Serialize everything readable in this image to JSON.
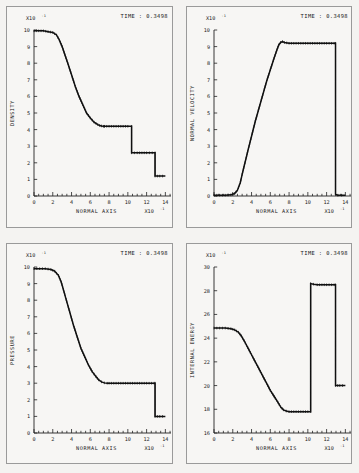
{
  "figure": {
    "background_color": "#f4f3f1",
    "panel_border_color": "#9a9a9a",
    "curve_color": "#111111",
    "time_prefix": "TIME :",
    "time_value": "0.3498",
    "time_label": "TIME : 0.3498"
  },
  "axis_common": {
    "xlabel": "NORMAL AXIS",
    "x_exponent_mantissa": "X10",
    "x_exponent_power": "-1",
    "y_exponent_mantissa": "X10",
    "y_exponent_power": "-1",
    "xticks": [
      0,
      2,
      4,
      6,
      8,
      10,
      12,
      14
    ],
    "xtick_labels": [
      "0",
      "2",
      "4",
      "6",
      "8",
      "10",
      "12",
      "14"
    ],
    "xlim": [
      0,
      14.6
    ]
  },
  "chart_data": [
    {
      "type": "line",
      "panel": "top-left",
      "title": "",
      "ylabel": "DENSITY",
      "xlabel": "NORMAL AXIS",
      "annotation": "TIME : 0.3498",
      "x_scale_label": "X10-1",
      "y_scale_label": "X10-1",
      "xlim": [
        0,
        14.6
      ],
      "ylim": [
        0,
        10
      ],
      "yticks": [
        0,
        1,
        2,
        3,
        4,
        5,
        6,
        7,
        8,
        9,
        10
      ],
      "ytick_labels": [
        "0",
        "1",
        "2",
        "3",
        "4",
        "5",
        "6",
        "7",
        "8",
        "9",
        "10"
      ],
      "grid": false,
      "legend": "none",
      "markers": "dense-tick-symbols",
      "series": [
        {
          "name": "density",
          "x": [
            0.0,
            0.5,
            1.0,
            1.5,
            2.0,
            2.4,
            2.7,
            3.0,
            3.3,
            3.6,
            4.0,
            4.4,
            4.8,
            5.2,
            5.6,
            6.0,
            6.4,
            6.8,
            7.0,
            7.2,
            7.4,
            7.5,
            7.5,
            8.0,
            9.0,
            10.0,
            10.4,
            10.4,
            11.0,
            12.0,
            12.9,
            12.9,
            13.4,
            14.0
          ],
          "y": [
            9.95,
            9.95,
            9.95,
            9.9,
            9.85,
            9.7,
            9.4,
            9.0,
            8.5,
            8.0,
            7.3,
            6.6,
            6.0,
            5.5,
            5.0,
            4.7,
            4.45,
            4.3,
            4.25,
            4.22,
            4.2,
            4.2,
            4.2,
            4.2,
            4.2,
            4.2,
            4.2,
            2.6,
            2.6,
            2.6,
            2.6,
            1.2,
            1.2,
            1.2
          ]
        }
      ]
    },
    {
      "type": "line",
      "panel": "top-right",
      "title": "",
      "ylabel": "NORMAL VELOCITY",
      "xlabel": "NORMAL AXIS",
      "annotation": "TIME : 0.3498",
      "x_scale_label": "X10-1",
      "y_scale_label": "X10-1",
      "xlim": [
        0,
        14.6
      ],
      "ylim": [
        0,
        10
      ],
      "yticks": [
        0,
        1,
        2,
        3,
        4,
        5,
        6,
        7,
        8,
        9,
        10
      ],
      "ytick_labels": [
        "0",
        "1",
        "2",
        "3",
        "4",
        "5",
        "6",
        "7",
        "8",
        "9",
        "10"
      ],
      "grid": false,
      "legend": "none",
      "markers": "dense-tick-symbols",
      "series": [
        {
          "name": "normal velocity",
          "x": [
            0.0,
            0.6,
            1.2,
            1.8,
            2.2,
            2.5,
            2.8,
            3.0,
            3.3,
            3.6,
            4.0,
            4.4,
            4.8,
            5.2,
            5.6,
            6.0,
            6.4,
            6.7,
            6.9,
            7.1,
            7.3,
            7.5,
            8.0,
            9.0,
            10.0,
            11.0,
            12.0,
            12.8,
            12.95,
            12.95,
            13.2,
            13.6,
            14.0
          ],
          "y": [
            0.05,
            0.05,
            0.05,
            0.07,
            0.15,
            0.35,
            0.8,
            1.3,
            2.0,
            2.7,
            3.6,
            4.5,
            5.3,
            6.1,
            6.9,
            7.6,
            8.3,
            8.8,
            9.1,
            9.25,
            9.3,
            9.25,
            9.2,
            9.2,
            9.2,
            9.2,
            9.2,
            9.2,
            9.2,
            0.1,
            0.05,
            0.05,
            0.05
          ]
        }
      ]
    },
    {
      "type": "line",
      "panel": "bottom-left",
      "title": "",
      "ylabel": "PRESSURE",
      "xlabel": "NORMAL AXIS",
      "annotation": "TIME : 0.3498",
      "x_scale_label": "X10-1",
      "y_scale_label": "X10-1",
      "xlim": [
        0,
        14.6
      ],
      "ylim": [
        0,
        10
      ],
      "yticks": [
        0,
        1,
        2,
        3,
        4,
        5,
        6,
        7,
        8,
        9,
        10
      ],
      "ytick_labels": [
        "0",
        "1",
        "2",
        "3",
        "4",
        "5",
        "6",
        "7",
        "8",
        "9",
        "10"
      ],
      "grid": false,
      "legend": "none",
      "markers": "dense-tick-symbols",
      "series": [
        {
          "name": "pressure",
          "x": [
            0.0,
            0.6,
            1.2,
            1.8,
            2.2,
            2.6,
            2.9,
            3.2,
            3.5,
            3.8,
            4.2,
            4.6,
            5.0,
            5.4,
            5.8,
            6.2,
            6.6,
            6.9,
            7.2,
            7.5,
            7.8,
            8.0,
            9.0,
            10.0,
            11.0,
            12.0,
            12.8,
            12.9,
            12.9,
            13.4,
            14.0
          ],
          "y": [
            9.9,
            9.9,
            9.9,
            9.85,
            9.75,
            9.5,
            9.1,
            8.5,
            7.9,
            7.3,
            6.5,
            5.8,
            5.1,
            4.6,
            4.1,
            3.7,
            3.4,
            3.2,
            3.08,
            3.02,
            3.0,
            3.0,
            3.0,
            3.0,
            3.0,
            3.0,
            3.0,
            3.0,
            1.0,
            1.0,
            1.0
          ]
        }
      ]
    },
    {
      "type": "line",
      "panel": "bottom-right",
      "title": "",
      "ylabel": "INTERNAL ENERGY",
      "xlabel": "NORMAL AXIS",
      "annotation": "TIME : 0.3498",
      "x_scale_label": "X10-1",
      "y_scale_label": "X10-1",
      "xlim": [
        0,
        14.6
      ],
      "ylim": [
        16,
        30
      ],
      "yticks": [
        16,
        18,
        20,
        22,
        24,
        26,
        28,
        30
      ],
      "ytick_labels": [
        "16",
        "18",
        "20",
        "22",
        "24",
        "26",
        "28",
        "30"
      ],
      "grid": false,
      "legend": "none",
      "markers": "dense-tick-symbols",
      "series": [
        {
          "name": "internal energy",
          "x": [
            0.0,
            0.6,
            1.2,
            1.8,
            2.2,
            2.6,
            2.9,
            3.2,
            3.6,
            4.0,
            4.4,
            4.8,
            5.2,
            5.6,
            6.0,
            6.4,
            6.8,
            7.1,
            7.4,
            7.7,
            8.0,
            9.0,
            10.0,
            10.3,
            10.3,
            10.6,
            11.0,
            12.0,
            12.8,
            12.95,
            12.95,
            13.4,
            14.0
          ],
          "y": [
            24.85,
            24.85,
            24.85,
            24.8,
            24.7,
            24.5,
            24.2,
            23.8,
            23.2,
            22.6,
            22.0,
            21.4,
            20.8,
            20.2,
            19.6,
            19.1,
            18.6,
            18.2,
            17.95,
            17.85,
            17.8,
            17.8,
            17.8,
            17.8,
            28.6,
            28.55,
            28.5,
            28.5,
            28.5,
            28.5,
            20.0,
            20.0,
            20.0
          ]
        }
      ]
    }
  ]
}
